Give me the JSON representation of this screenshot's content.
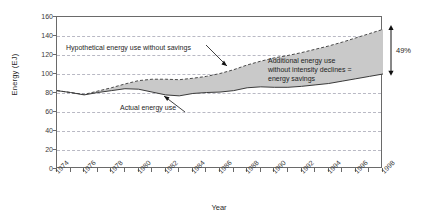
{
  "chart_data": {
    "type": "area",
    "title": "",
    "xlabel": "Year",
    "ylabel": "Energy (EJ)",
    "xlim": [
      1974,
      1998
    ],
    "ylim": [
      0,
      160
    ],
    "grid": true,
    "legend_position": "none",
    "y_ticks": [
      0,
      20,
      40,
      60,
      80,
      100,
      120,
      140,
      160
    ],
    "x_ticks": [
      1974,
      1975,
      1976,
      1977,
      1978,
      1979,
      1980,
      1981,
      1982,
      1983,
      1984,
      1985,
      1986,
      1987,
      1988,
      1989,
      1990,
      1991,
      1992,
      1993,
      1994,
      1995,
      1996,
      1997,
      1998
    ],
    "x_tick_labels": [
      "1974",
      "",
      "1976",
      "",
      "1978",
      "",
      "1980",
      "",
      "1982",
      "",
      "1984",
      "",
      "1986",
      "",
      "1988",
      "",
      "1990",
      "",
      "1992",
      "",
      "1994",
      "",
      "1996",
      "",
      "1998"
    ],
    "x": [
      1974,
      1975,
      1976,
      1977,
      1978,
      1979,
      1980,
      1981,
      1982,
      1983,
      1984,
      1985,
      1986,
      1987,
      1988,
      1989,
      1990,
      1991,
      1992,
      1993,
      1994,
      1995,
      1996,
      1997,
      1998
    ],
    "series": [
      {
        "name": "Actual energy use",
        "style": "solid",
        "values": [
          82.5,
          80.5,
          78.0,
          80.5,
          82.5,
          84.5,
          84.0,
          81.0,
          78.0,
          77.0,
          79.5,
          80.5,
          81.0,
          82.5,
          85.5,
          86.5,
          86.0,
          86.0,
          87.0,
          88.5,
          90.0,
          92.5,
          95.0,
          97.5,
          100.0
        ]
      },
      {
        "name": "Hypothetical energy use without savings",
        "style": "dashed",
        "values": [
          82.5,
          80.5,
          78.5,
          82.0,
          85.5,
          89.5,
          93.0,
          94.5,
          94.5,
          94.0,
          95.5,
          97.5,
          100.5,
          104.5,
          109.5,
          113.5,
          117.0,
          119.5,
          122.5,
          126.0,
          129.5,
          133.5,
          138.0,
          142.5,
          147.0
        ]
      }
    ],
    "fill": {
      "label": "energy savings band",
      "color": "#c9c9c9",
      "between": [
        "Actual energy use",
        "Hypothetical energy use without savings"
      ]
    },
    "annotations": [
      {
        "name": "hypothetical-label",
        "text": "Hypothetical energy use without savings",
        "has_leader_line": true
      },
      {
        "name": "actual-label",
        "text": "Actual energy use",
        "has_leader_line": true
      },
      {
        "name": "savings-label",
        "lines": [
          "Additional energy use",
          "without intensity declines =",
          "energy savings"
        ]
      },
      {
        "name": "percent-bracket",
        "text": "49%",
        "arrow": "double-headed-vertical",
        "from_value": 100,
        "to_value": 147
      }
    ]
  }
}
